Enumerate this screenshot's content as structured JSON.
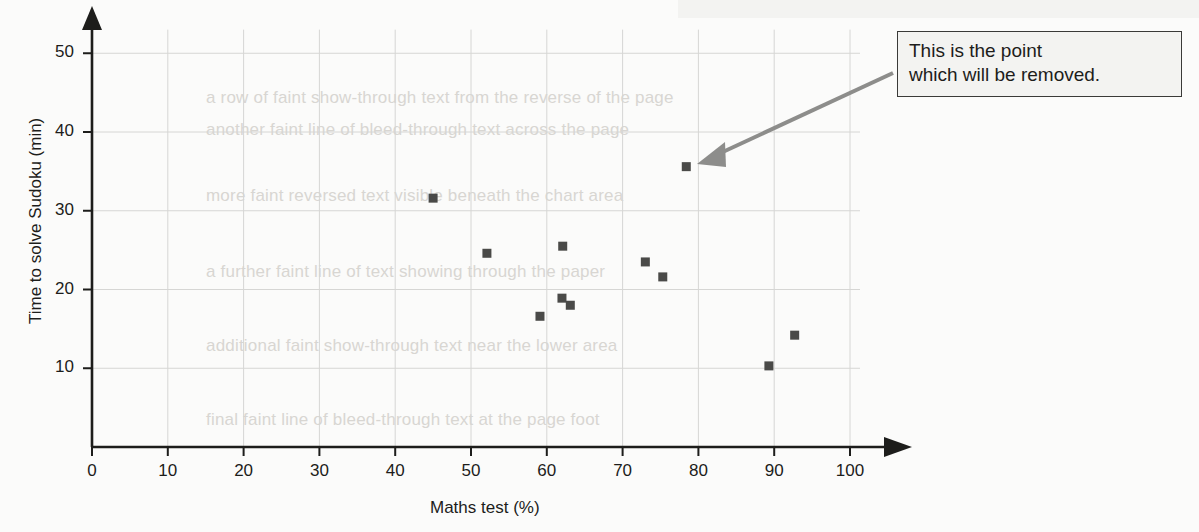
{
  "chart_data": {
    "type": "scatter",
    "title": "",
    "xlabel": "Maths test (%)",
    "ylabel": "Time to solve Sudoku (min)",
    "xlim": [
      0,
      100
    ],
    "ylim": [
      0,
      53
    ],
    "xticks": [
      0,
      10,
      20,
      30,
      40,
      50,
      60,
      70,
      80,
      90,
      100
    ],
    "yticks": [
      10,
      20,
      30,
      40,
      50
    ],
    "xtick_labels": [
      "0",
      "10",
      "20",
      "30",
      "40",
      "50",
      "60",
      "70",
      "80",
      "90",
      "100"
    ],
    "ytick_labels": [
      "10",
      "20",
      "30",
      "40",
      "50"
    ],
    "grid": true,
    "grid_color": "#d6d6d4",
    "legend": null,
    "marker": "square",
    "marker_color": "#4a4a48",
    "points": [
      {
        "x": 45.0,
        "y": 31.6,
        "highlighted": false
      },
      {
        "x": 52.1,
        "y": 24.6,
        "highlighted": false
      },
      {
        "x": 59.1,
        "y": 16.6,
        "highlighted": false
      },
      {
        "x": 62.1,
        "y": 25.5,
        "highlighted": false
      },
      {
        "x": 62.0,
        "y": 18.9,
        "highlighted": false
      },
      {
        "x": 63.1,
        "y": 18.0,
        "highlighted": false
      },
      {
        "x": 73.0,
        "y": 23.5,
        "highlighted": false
      },
      {
        "x": 75.3,
        "y": 21.6,
        "highlighted": false
      },
      {
        "x": 78.4,
        "y": 35.6,
        "highlighted": true
      },
      {
        "x": 89.3,
        "y": 10.3,
        "highlighted": false
      },
      {
        "x": 92.7,
        "y": 14.2,
        "highlighted": false
      }
    ],
    "annotations": [
      {
        "text_line1": "This is the point",
        "text_line2": "which will be removed.",
        "points_to": {
          "x": 78.4,
          "y": 35.6
        }
      }
    ]
  },
  "annotation": {
    "line1": "This is the point",
    "line2": "which will be removed."
  },
  "colors": {
    "axis": "#1d1d1b",
    "grid": "#d6d6d4",
    "marker": "#4a4a48",
    "arrow": "#8d8d8b",
    "callout_border": "#3a3a38",
    "callout_fill": "#f3f3f1",
    "page_background": "#fbfbfa"
  },
  "background_text": {
    "lines": [
      "a row of faint show-through text from the reverse of the page",
      "another faint line of bleed-through text across the page",
      "more faint reversed text visible beneath the chart area",
      "a further faint line of text showing through the paper",
      "additional faint show-through text near the lower area",
      "final faint line of bleed-through text at the page foot"
    ]
  }
}
